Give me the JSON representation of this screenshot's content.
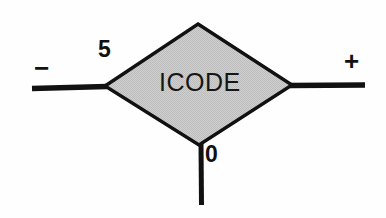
{
  "diagram": {
    "type": "signal-flow-block-diagram",
    "block": {
      "shape": "diamond",
      "label": "ICODE",
      "fill_color": "#c9c9c9",
      "border_color": "#111111",
      "border_width": 3,
      "center": {
        "x": 199,
        "y": 85
      },
      "vertices": {
        "top": {
          "x": 198,
          "y": 24
        },
        "right": {
          "x": 292,
          "y": 85
        },
        "bottom": {
          "x": 199,
          "y": 145
        },
        "left": {
          "x": 105,
          "y": 86
        }
      }
    },
    "ports": [
      {
        "name": "left-port",
        "sign": "−",
        "gain": "5",
        "line": {
          "x1": 32,
          "y1": 88,
          "x2": 105,
          "y2": 86
        }
      },
      {
        "name": "right-port",
        "sign": "+",
        "gain": "",
        "line": {
          "x1": 292,
          "y1": 85,
          "x2": 365,
          "y2": 85
        }
      },
      {
        "name": "bottom-port",
        "sign": "",
        "gain": "0",
        "line": {
          "x1": 201,
          "y1": 145,
          "x2": 201,
          "y2": 205
        }
      }
    ],
    "labels": {
      "gain_five": "5",
      "gain_zero": "0",
      "sign_minus": "−",
      "sign_plus": "+",
      "block_name": "ICODE"
    },
    "colors": {
      "background": "#fefefe",
      "ink": "#111111",
      "block_fill": "#c9c9c9"
    }
  }
}
